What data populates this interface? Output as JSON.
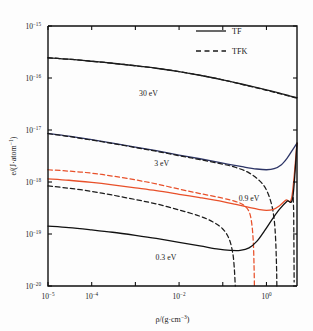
{
  "chart_data": {
    "type": "line",
    "title": "",
    "xlabel": "ρ/(g·cm⁻³)",
    "ylabel": "e/(J·atom⁻¹)",
    "xscale": "log",
    "yscale": "log",
    "xlim": [
      1e-05,
      5.0
    ],
    "ylim": [
      1e-20,
      1e-15
    ],
    "grid": false,
    "xticks_labeled": [
      "10⁻⁵",
      "10⁻⁴",
      "10⁻²",
      "10⁰"
    ],
    "xtick_values": [
      1e-05,
      0.0001,
      0.01,
      1.0
    ],
    "yticks_labeled": [
      "10⁻¹⁵",
      "10⁻¹⁶",
      "10⁻¹⁷",
      "10⁻¹⁸",
      "10⁻¹⁹",
      "10⁻²⁰"
    ],
    "ytick_values": [
      1e-15,
      1e-16,
      1e-17,
      1e-18,
      1e-19,
      1e-20
    ],
    "legend": {
      "position": "top-right",
      "entries": [
        {
          "label": "TF",
          "style": "solid"
        },
        {
          "label": "TFK",
          "style": "dashed"
        }
      ]
    },
    "annotations": [
      {
        "text": "30 eV",
        "x": 0.002,
        "y": 4.6e-17
      },
      {
        "text": "3 eV",
        "x": 0.004,
        "y": 2e-18
      },
      {
        "text": "0.9 eV",
        "x": 0.4,
        "y": 4.3e-19
      },
      {
        "text": "0.3 eV",
        "x": 0.005,
        "y": 3.2e-20
      }
    ],
    "series": [
      {
        "name": "30 eV TF",
        "temperature_eV": 30,
        "model": "TF",
        "style": "solid",
        "color": "#1c1c1c",
        "points": [
          [
            1e-05,
            2.45e-16
          ],
          [
            3e-05,
            2.3e-16
          ],
          [
            0.0001,
            2.1e-16
          ],
          [
            0.0003,
            1.92e-16
          ],
          [
            0.001,
            1.72e-16
          ],
          [
            0.003,
            1.54e-16
          ],
          [
            0.01,
            1.33e-16
          ],
          [
            0.03,
            1.13e-16
          ],
          [
            0.1,
            9.2e-17
          ],
          [
            0.3,
            7.5e-17
          ],
          [
            1.0,
            5.9e-17
          ],
          [
            2.0,
            5.1e-17
          ],
          [
            3.5,
            4.5e-17
          ],
          [
            5.0,
            4.2e-17
          ]
        ]
      },
      {
        "name": "30 eV TFK",
        "temperature_eV": 30,
        "model": "TFK",
        "style": "dashed",
        "color": "#1c1c1c",
        "points": [
          [
            1e-05,
            2.45e-16
          ],
          [
            3e-05,
            2.3e-16
          ],
          [
            0.0001,
            2.1e-16
          ],
          [
            0.0003,
            1.92e-16
          ],
          [
            0.001,
            1.72e-16
          ],
          [
            0.003,
            1.54e-16
          ],
          [
            0.01,
            1.33e-16
          ],
          [
            0.03,
            1.13e-16
          ],
          [
            0.1,
            9.2e-17
          ],
          [
            0.3,
            7.4e-17
          ],
          [
            1.0,
            5.8e-17
          ],
          [
            2.0,
            5e-17
          ],
          [
            3.5,
            4.4e-17
          ],
          [
            5.0,
            4.1e-17
          ]
        ]
      },
      {
        "name": "3 eV TF",
        "temperature_eV": 3,
        "model": "TF",
        "style": "solid",
        "color": "#2d3566",
        "points": [
          [
            1e-05,
            8.6e-18
          ],
          [
            3e-05,
            7.6e-18
          ],
          [
            0.0001,
            6.5e-18
          ],
          [
            0.0003,
            5.6e-18
          ],
          [
            0.001,
            4.7e-18
          ],
          [
            0.003,
            4e-18
          ],
          [
            0.01,
            3.3e-18
          ],
          [
            0.03,
            2.8e-18
          ],
          [
            0.1,
            2.3e-18
          ],
          [
            0.3,
            1.95e-18
          ],
          [
            0.6,
            1.78e-18
          ],
          [
            1.0,
            1.72e-18
          ],
          [
            1.5,
            1.8e-18
          ],
          [
            2.2,
            2.15e-18
          ],
          [
            3.0,
            2.9e-18
          ],
          [
            4.0,
            4.2e-18
          ],
          [
            5.0,
            5.6e-18
          ]
        ]
      },
      {
        "name": "3 eV TFK",
        "temperature_eV": 3,
        "model": "TFK",
        "style": "dashed",
        "color": "#1c1c1c",
        "points": [
          [
            1e-05,
            8.5e-18
          ],
          [
            3e-05,
            7.5e-18
          ],
          [
            0.0001,
            6.4e-18
          ],
          [
            0.0003,
            5.5e-18
          ],
          [
            0.001,
            4.6e-18
          ],
          [
            0.003,
            3.9e-18
          ],
          [
            0.01,
            3.2e-18
          ],
          [
            0.03,
            2.7e-18
          ],
          [
            0.1,
            2.2e-18
          ],
          [
            0.2,
            1.9e-18
          ],
          [
            0.4,
            1.5e-18
          ],
          [
            0.7,
            1.05e-18
          ],
          [
            1.0,
            7e-19
          ],
          [
            1.3,
            3.8e-19
          ],
          [
            1.5,
            1.9e-19
          ],
          [
            1.62,
            8e-20
          ],
          [
            1.7,
            2.4e-20
          ],
          [
            1.73,
            1e-20
          ]
        ]
      },
      {
        "name": "0.9 eV TF",
        "temperature_eV": 0.9,
        "model": "TF",
        "style": "solid",
        "color": "#e8502a",
        "points": [
          [
            1e-05,
            1.15e-18
          ],
          [
            3e-05,
            1.08e-18
          ],
          [
            0.0001,
            9.8e-19
          ],
          [
            0.0003,
            8.8e-19
          ],
          [
            0.001,
            7.7e-19
          ],
          [
            0.003,
            6.8e-19
          ],
          [
            0.01,
            5.8e-19
          ],
          [
            0.03,
            5e-19
          ],
          [
            0.1,
            4.2e-19
          ],
          [
            0.2,
            3.7e-19
          ],
          [
            0.4,
            3.25e-19
          ],
          [
            0.7,
            2.95e-19
          ],
          [
            1.0,
            2.85e-19
          ],
          [
            1.4,
            2.95e-19
          ],
          [
            2.0,
            3.5e-19
          ],
          [
            2.8,
            4.5e-19
          ],
          [
            3.8,
            5.1e-19
          ],
          [
            5.0,
            5.6e-18
          ]
        ]
      },
      {
        "name": "0.9 eV TFK",
        "temperature_eV": 0.9,
        "model": "TFK",
        "style": "dashed",
        "color": "#e8502a",
        "points": [
          [
            1e-05,
            1.72e-18
          ],
          [
            3e-05,
            1.62e-18
          ],
          [
            0.0001,
            1.48e-18
          ],
          [
            0.0003,
            1.3e-18
          ],
          [
            0.001,
            1.1e-18
          ],
          [
            0.003,
            9.2e-19
          ],
          [
            0.01,
            7.3e-19
          ],
          [
            0.03,
            6e-19
          ],
          [
            0.1,
            4.9e-19
          ],
          [
            0.2,
            4.2e-19
          ],
          [
            0.3,
            3.6e-19
          ],
          [
            0.4,
            2.7e-19
          ],
          [
            0.46,
            1.6e-19
          ],
          [
            0.5,
            7e-20
          ],
          [
            0.52,
            2.4e-20
          ],
          [
            0.53,
            1e-20
          ]
        ]
      },
      {
        "name": "0.3 eV TF",
        "temperature_eV": 0.3,
        "model": "TF",
        "style": "solid",
        "color": "#111111",
        "points": [
          [
            1e-05,
            1.42e-19
          ],
          [
            3e-05,
            1.33e-19
          ],
          [
            0.0001,
            1.2e-19
          ],
          [
            0.0003,
            1.08e-19
          ],
          [
            0.001,
            9.4e-20
          ],
          [
            0.003,
            8.2e-20
          ],
          [
            0.01,
            6.9e-20
          ],
          [
            0.03,
            5.9e-20
          ],
          [
            0.08,
            5.1e-20
          ],
          [
            0.15,
            4.85e-20
          ],
          [
            0.25,
            4.85e-20
          ],
          [
            0.4,
            5.4e-20
          ],
          [
            0.6,
            7.2e-20
          ],
          [
            0.9,
            1.15e-19
          ],
          [
            1.4,
            2e-19
          ],
          [
            2.0,
            3e-19
          ],
          [
            3.0,
            4.3e-19
          ],
          [
            4.0,
            5e-19
          ],
          [
            5.0,
            5.6e-18
          ]
        ]
      },
      {
        "name": "0.3 eV TFK",
        "temperature_eV": 0.3,
        "model": "TFK",
        "style": "dashed",
        "color": "#1c1c1c",
        "points": [
          [
            1e-05,
            8.4e-19
          ],
          [
            3e-05,
            7.6e-19
          ],
          [
            0.0001,
            6.6e-19
          ],
          [
            0.0003,
            5.6e-19
          ],
          [
            0.001,
            4.6e-19
          ],
          [
            0.003,
            3.8e-19
          ],
          [
            0.01,
            2.9e-19
          ],
          [
            0.03,
            2.2e-19
          ],
          [
            0.06,
            1.7e-19
          ],
          [
            0.1,
            1.25e-19
          ],
          [
            0.14,
            8e-20
          ],
          [
            0.17,
            4.2e-20
          ],
          [
            0.185,
            2e-20
          ],
          [
            0.193,
            1e-20
          ]
        ]
      },
      {
        "name": "right-edge TFK fragment",
        "temperature_eV": null,
        "model": "TFK",
        "style": "dashed",
        "color": "#1c1c1c",
        "points": [
          [
            4.1,
            5e-19
          ],
          [
            4.15,
            3.6e-19
          ],
          [
            4.2,
            2.6e-19
          ],
          [
            4.22,
            1.4e-19
          ],
          [
            4.25,
            6e-20
          ],
          [
            4.28,
            2.4e-20
          ],
          [
            4.3,
            1.2e-20
          ]
        ]
      }
    ]
  },
  "figure": {
    "legend_label_tf": "TF",
    "legend_label_tfk": "TFK",
    "xlabel_main": "ρ/(g·cm",
    "xlabel_exp": "−3",
    "xlabel_tail": ")",
    "ylabel_main": "e/(J·atom",
    "ylabel_exp": "−1",
    "ylabel_tail": ")"
  }
}
